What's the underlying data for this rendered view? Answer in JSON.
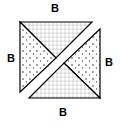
{
  "diagram": {
    "labels": {
      "top": "B",
      "left": "B",
      "right": "B",
      "bottom": "B"
    },
    "regions": [
      {
        "name": "upper-triangle-top-part",
        "texture": "grid-dots"
      },
      {
        "name": "upper-triangle-left-part",
        "texture": "scattered-dots"
      },
      {
        "name": "lower-triangle-right-part",
        "texture": "scattered-dots"
      },
      {
        "name": "lower-triangle-bottom-part",
        "texture": "grid-dots"
      }
    ],
    "colors": {
      "stroke": "#000000",
      "fill": "#ffffff"
    }
  }
}
